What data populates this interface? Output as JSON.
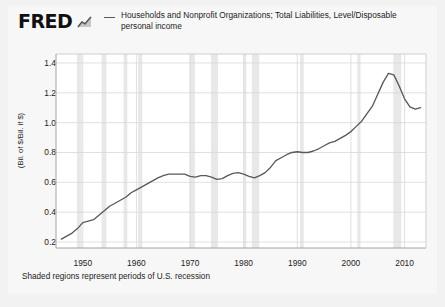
{
  "brand": {
    "name": "FRED",
    "mark_icon": "mini-line-chart-icon"
  },
  "legend": {
    "swatch_icon": "line-swatch-icon",
    "label": "Households and Nonprofit Organizations; Total Liabilities, Level/Disposable personal income",
    "color": "#555a60"
  },
  "footer": {
    "note": "Shaded regions represent periods of U.S. recession"
  },
  "colors": {
    "line": "#555a60",
    "recession_band": "#e8e8e8",
    "grid": "#d8d8d8",
    "plot_background": "#ffffff",
    "card_background": "#f7f7f7",
    "page_background": "#f2f2f2"
  },
  "chart_data": {
    "type": "line",
    "title": "",
    "subtitle": "",
    "xlabel": "",
    "ylabel": "(Bil. of $/Bil. if $)",
    "xlim": [
      1945,
      2014
    ],
    "ylim": [
      0.16,
      1.46
    ],
    "grid": true,
    "legend_position": "top",
    "ytick_labels": [
      "1.4",
      "1.2",
      "1.0",
      "0.8",
      "0.6",
      "0.4",
      "0.2"
    ],
    "yticks": [
      1.4,
      1.2,
      1.0,
      0.8,
      0.6,
      0.4,
      0.2
    ],
    "xtick_labels": [
      "1950",
      "1960",
      "1970",
      "1980",
      "1990",
      "2000",
      "2010"
    ],
    "xticks": [
      1950,
      1960,
      1970,
      1980,
      1990,
      2000,
      2010
    ],
    "series": [
      {
        "name": "Households and Nonprofit Organizations; Total Liabilities, Level/Disposable personal income",
        "color": "#555a60",
        "x": [
          1946,
          1947,
          1948,
          1949,
          1950,
          1951,
          1952,
          1953,
          1954,
          1955,
          1956,
          1957,
          1958,
          1959,
          1960,
          1961,
          1962,
          1963,
          1964,
          1965,
          1966,
          1967,
          1968,
          1969,
          1970,
          1971,
          1972,
          1973,
          1974,
          1975,
          1976,
          1977,
          1978,
          1979,
          1980,
          1981,
          1982,
          1983,
          1984,
          1985,
          1986,
          1987,
          1988,
          1989,
          1990,
          1991,
          1992,
          1993,
          1994,
          1995,
          1996,
          1997,
          1998,
          1999,
          2000,
          2001,
          2002,
          2003,
          2004,
          2005,
          2006,
          2007,
          2008,
          2009,
          2010,
          2011,
          2012,
          2013
        ],
        "values": [
          0.22,
          0.24,
          0.26,
          0.29,
          0.33,
          0.34,
          0.35,
          0.38,
          0.41,
          0.44,
          0.46,
          0.48,
          0.5,
          0.53,
          0.55,
          0.57,
          0.59,
          0.61,
          0.63,
          0.645,
          0.655,
          0.655,
          0.655,
          0.655,
          0.64,
          0.635,
          0.645,
          0.645,
          0.635,
          0.62,
          0.625,
          0.645,
          0.66,
          0.665,
          0.655,
          0.64,
          0.63,
          0.645,
          0.665,
          0.7,
          0.745,
          0.765,
          0.785,
          0.8,
          0.805,
          0.8,
          0.8,
          0.81,
          0.825,
          0.845,
          0.865,
          0.875,
          0.895,
          0.915,
          0.94,
          0.975,
          1.01,
          1.06,
          1.11,
          1.19,
          1.27,
          1.33,
          1.32,
          1.245,
          1.16,
          1.105,
          1.09,
          1.1
        ]
      }
    ],
    "recessions": [
      {
        "start": 1948.9,
        "end": 1949.8
      },
      {
        "start": 1953.5,
        "end": 1954.4
      },
      {
        "start": 1957.6,
        "end": 1958.3
      },
      {
        "start": 1960.3,
        "end": 1961.1
      },
      {
        "start": 1969.9,
        "end": 1970.9
      },
      {
        "start": 1973.9,
        "end": 1975.2
      },
      {
        "start": 1980.0,
        "end": 1980.5
      },
      {
        "start": 1981.5,
        "end": 1982.9
      },
      {
        "start": 1990.5,
        "end": 1991.2
      },
      {
        "start": 2001.2,
        "end": 2001.8
      },
      {
        "start": 2007.9,
        "end": 2009.4
      }
    ]
  }
}
